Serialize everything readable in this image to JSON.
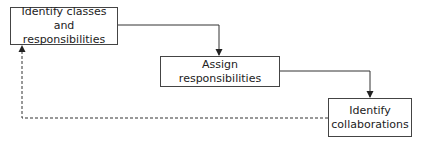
{
  "diagram": {
    "title": "",
    "nodes": [
      {
        "id": "n1",
        "label": "Identify classes and responsibilities"
      },
      {
        "id": "n2",
        "label": "Assign responsibilities"
      },
      {
        "id": "n3",
        "label": "Identify collaborations"
      }
    ],
    "edges": [
      {
        "from": "n1",
        "to": "n2",
        "style": "solid"
      },
      {
        "from": "n2",
        "to": "n3",
        "style": "solid"
      },
      {
        "from": "n3",
        "to": "n1",
        "style": "dashed"
      }
    ],
    "colors": {
      "line": "#333333",
      "border": "#444444",
      "background": "#ffffff"
    }
  }
}
